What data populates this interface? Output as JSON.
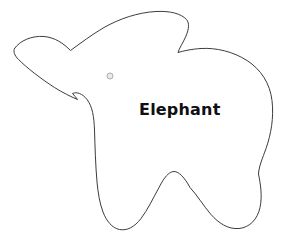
{
  "canvas": {
    "width": 295,
    "height": 250,
    "background_color": "#ffffff"
  },
  "template": {
    "subject_name": "Elephant",
    "label": "Elephant",
    "outline_color": "#3b3b44",
    "fill_color": "#ffffff",
    "outline_width": 1
  },
  "eye": {
    "name": "eye",
    "center_x": 110,
    "center_y": 76,
    "radius": 3,
    "fill_color": "#e9e9ee",
    "stroke_color": "#a9a9b2"
  },
  "outline": {
    "path": "M 14.5 48.5 C 20 40.5 32 35.5 44 36.5 C 55 37.4 63.5 43.5 70.5 50.5 C 80 43.5 92 34.5 104 27.5 C 120 18.5 138 12.5 156 11.5 C 170 10.8 181 13.5 186.5 19.5 C 189.5 23.0 189.0 29.0 186.0 36.0 C 183.0 43.0 179.0 48.5 178.0 52.5 C 183.0 51.0 192.0 49.0 201.0 48.5 C 216.0 47.6 233.0 51.5 247.0 60.5 C 261.0 69.5 270.0 83.5 272.0 100.5 C 274.0 117.5 271.0 134.5 266.0 148.5 C 262.5 158.5 259.0 166.0 258.5 174.0 C 260.5 184.0 262.5 196.0 260.0 207.5 C 257.5 219.0 250.0 227.5 239.0 228.5 C 228.0 229.5 218.5 223.0 211.0 214.5 C 203.5 206.0 197.5 195.5 190.0 187.5 C 184.5 177.5 179.0 171.5 174.0 171.5 C 169.0 171.5 164.0 177.5 159.0 187.5 C 153.0 198.5 147.5 210.0 141.0 218.5 C 134.5 227.0 127.0 231.0 119.5 229.5 C 112.0 228.0 106.5 221.0 103.0 212.0 C 99.5 203.0 98.0 192.0 97.0 182.0 C 95.5 165.0 95.0 146.5 94.5 130.0 C 94.0 117.0 92.5 106.5 87.0 99.5 C 82.5 93.5 76.5 91.5 72.5 93.5 C 74.5 95.5 76.0 97.5 77.5 99.5 C 70.5 96.5 62.5 92.5 54.5 87.5 C 40.5 78.5 26.5 67.5 18.5 59.5 C 14.5 55.5 13.0 51.5 14.5 48.5 Z"
  },
  "elements": {
    "shape_name": "elephant-outline",
    "label_text": "Elephant"
  }
}
